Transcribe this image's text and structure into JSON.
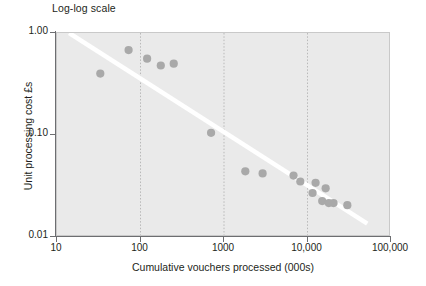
{
  "chart_data": {
    "type": "scatter",
    "title": "Log-log scale",
    "xlabel": "Cumulative vouchers processed (000s)",
    "ylabel": "Unit processing cost £s",
    "xscale": "log",
    "yscale": "log",
    "xlim": [
      10,
      100000
    ],
    "ylim": [
      0.01,
      1.0
    ],
    "grid": "vertical-dotted-at-decades",
    "legend": "none",
    "x_tick_labels": [
      "10",
      "100",
      "1000",
      "10,000",
      "100,000"
    ],
    "x_tick_values": [
      10,
      100,
      1000,
      10000,
      100000
    ],
    "y_tick_labels": [
      "1.00",
      "0.10",
      "0.01"
    ],
    "y_tick_values": [
      1.0,
      0.1,
      0.01
    ],
    "series": [
      {
        "name": "Unit processing cost",
        "marker": "circle",
        "color": "#a9a9a9",
        "x": [
          33,
          72,
          120,
          175,
          250,
          700,
          1800,
          2900,
          6800,
          8200,
          11500,
          12500,
          15000,
          16500,
          18000,
          20500,
          30000
        ],
        "y": [
          0.4,
          0.68,
          0.56,
          0.48,
          0.5,
          0.105,
          0.044,
          0.042,
          0.04,
          0.035,
          0.027,
          0.034,
          0.0225,
          0.03,
          0.0215,
          0.0215,
          0.0205
        ]
      }
    ],
    "trendline": {
      "type": "power-law-fit",
      "color": "#ffffff",
      "x_start": 14,
      "y_start": 1.0,
      "x_end": 52000,
      "y_end": 0.0135
    }
  },
  "axes": {
    "x_ticks": [
      {
        "label": "10",
        "value": 10
      },
      {
        "label": "100",
        "value": 100
      },
      {
        "label": "1000",
        "value": 1000
      },
      {
        "label": "10,000",
        "value": 10000
      },
      {
        "label": "100,000",
        "value": 100000
      }
    ],
    "y_ticks": [
      {
        "label": "1.00",
        "value": 1.0
      },
      {
        "label": "0.10",
        "value": 0.1
      },
      {
        "label": "0.01",
        "value": 0.01
      }
    ]
  }
}
